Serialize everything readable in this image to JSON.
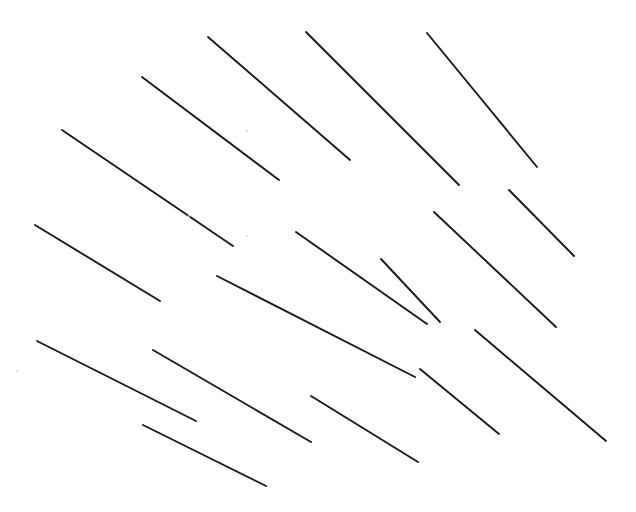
{
  "canvas": {
    "width": 636,
    "height": 512,
    "background_color": "#ffffff",
    "stroke_color": "#1a1a1a",
    "stroke_width": 1.9,
    "description": "Field of 17 isolated dark diagonal line segments on a plain white field, all oriented down-and-to-the-right."
  },
  "chart_data": {
    "type": "scatter",
    "title": "",
    "subtitle": "",
    "xlabel": "",
    "ylabel": "",
    "xlim": [
      0,
      636
    ],
    "ylim": [
      0,
      512
    ],
    "grid": false,
    "legend": null,
    "annotations": [],
    "tick_labels": {
      "x": [],
      "y": []
    },
    "series": [
      {
        "name": "line-segments",
        "color": "#1a1a1a",
        "count": 17,
        "segments": [
          {
            "id": "seg-01",
            "x1": 62,
            "y1": 130,
            "x2": 233,
            "y2": 246,
            "angle_deg": 34.1,
            "length": 206
          },
          {
            "id": "seg-02",
            "x1": 142,
            "y1": 77,
            "x2": 279,
            "y2": 180,
            "angle_deg": 36.9,
            "length": 171
          },
          {
            "id": "seg-03",
            "x1": 208,
            "y1": 37,
            "x2": 350,
            "y2": 160,
            "angle_deg": 40.9,
            "length": 188
          },
          {
            "id": "seg-04",
            "x1": 306,
            "y1": 32,
            "x2": 459,
            "y2": 185,
            "angle_deg": 45.0,
            "length": 216
          },
          {
            "id": "seg-05",
            "x1": 427,
            "y1": 33,
            "x2": 537,
            "y2": 167,
            "angle_deg": 50.6,
            "length": 173
          },
          {
            "id": "seg-06",
            "x1": 35,
            "y1": 225,
            "x2": 160,
            "y2": 301,
            "angle_deg": 31.3,
            "length": 146
          },
          {
            "id": "seg-07",
            "x1": 217,
            "y1": 276,
            "x2": 415,
            "y2": 377,
            "angle_deg": 27.0,
            "length": 222
          },
          {
            "id": "seg-08",
            "x1": 296,
            "y1": 232,
            "x2": 427,
            "y2": 324,
            "angle_deg": 35.1,
            "length": 160
          },
          {
            "id": "seg-09",
            "x1": 434,
            "y1": 212,
            "x2": 556,
            "y2": 327,
            "angle_deg": 43.3,
            "length": 168
          },
          {
            "id": "seg-10",
            "x1": 509,
            "y1": 190,
            "x2": 574,
            "y2": 256,
            "angle_deg": 45.4,
            "length": 93
          },
          {
            "id": "seg-11",
            "x1": 37,
            "y1": 341,
            "x2": 196,
            "y2": 421,
            "angle_deg": 26.7,
            "length": 178
          },
          {
            "id": "seg-12",
            "x1": 153,
            "y1": 350,
            "x2": 311,
            "y2": 442,
            "angle_deg": 30.2,
            "length": 183
          },
          {
            "id": "seg-13",
            "x1": 143,
            "y1": 425,
            "x2": 266,
            "y2": 486,
            "angle_deg": 26.4,
            "length": 137
          },
          {
            "id": "seg-14",
            "x1": 311,
            "y1": 396,
            "x2": 418,
            "y2": 462,
            "angle_deg": 31.7,
            "length": 126
          },
          {
            "id": "seg-15",
            "x1": 420,
            "y1": 369,
            "x2": 499,
            "y2": 434,
            "angle_deg": 39.5,
            "length": 102
          },
          {
            "id": "seg-16",
            "x1": 475,
            "y1": 330,
            "x2": 606,
            "y2": 441,
            "angle_deg": 40.3,
            "length": 172
          },
          {
            "id": "seg-17",
            "x1": 381,
            "y1": 259,
            "x2": 440,
            "y2": 322,
            "angle_deg": 46.9,
            "length": 86
          }
        ]
      }
    ],
    "specks": [
      {
        "id": "speck-01",
        "cx": 247,
        "cy": 131,
        "r": 1.1
      },
      {
        "id": "speck-02",
        "cx": 247,
        "cy": 236,
        "r": 0.9
      },
      {
        "id": "speck-03",
        "cx": 17,
        "cy": 371,
        "r": 0.9
      },
      {
        "id": "speck-04",
        "cx": 189,
        "cy": 216,
        "r": 0.9
      }
    ]
  }
}
